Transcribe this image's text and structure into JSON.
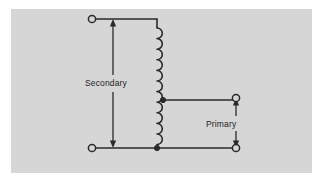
{
  "figure": {
    "background_color": "#ffffff",
    "panel_color": "#d6d6d6",
    "line_color": "#2a2a2a",
    "panel": {
      "x": 11,
      "y": 9,
      "width": 301,
      "height": 164
    }
  },
  "labels": {
    "secondary": "Secondary",
    "primary": "Primary"
  },
  "terminals": [
    {
      "name": "secondary-top-terminal",
      "x": 92,
      "y": 19,
      "r": 3.6
    },
    {
      "name": "secondary-bottom-terminal",
      "x": 92,
      "y": 148,
      "r": 3.6
    },
    {
      "name": "primary-top-terminal",
      "x": 236,
      "y": 98,
      "r": 3.6
    },
    {
      "name": "primary-bottom-terminal",
      "x": 236,
      "y": 148,
      "r": 3.6
    }
  ],
  "junctions": [
    {
      "name": "coil-tap-junction",
      "x": 163,
      "y": 100,
      "r": 2.6
    },
    {
      "name": "coil-bottom-junction",
      "x": 157,
      "y": 148,
      "r": 2.6
    }
  ],
  "coil": {
    "name": "winding-coil",
    "x_spine": 157,
    "top_y": 28,
    "bottom_y": 145,
    "turns": 11,
    "bulge": 11
  },
  "arrows": {
    "secondary": {
      "x": 113,
      "top_y": 19,
      "bottom_y": 148,
      "head_top": "up",
      "head_bottom": "down",
      "gap_top": 75,
      "gap_bottom": 92
    },
    "primary": {
      "x": 236,
      "top_y": 98,
      "bottom_y": 148,
      "head_top": "up",
      "head_bottom": "down",
      "gap_top": 116,
      "gap_bottom": 131
    }
  },
  "wires": [
    {
      "name": "secondary-top-wire",
      "points": "95.6,19 157,19 157,28"
    },
    {
      "name": "secondary-bottom-wire",
      "points": "95.6,148 236,148"
    },
    {
      "name": "primary-tap-wire",
      "points": "163,100 236,100"
    }
  ]
}
